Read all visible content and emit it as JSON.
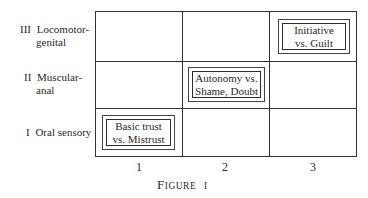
{
  "figure": {
    "caption_first": "F",
    "caption_rest": "igure",
    "caption_num": "I",
    "rows": [
      {
        "numeral": "III",
        "label_line1": "Locomotor-",
        "label_line2": "genital"
      },
      {
        "numeral": "II",
        "label_line1": "Muscular-",
        "label_line2": "anal"
      },
      {
        "numeral": "I",
        "label_line1": "Oral sensory",
        "label_line2": ""
      }
    ],
    "columns": [
      "1",
      "2",
      "3"
    ],
    "cells": [
      {
        "row": "III",
        "col": "3",
        "line1": "Initiative",
        "line2": "vs. Guilt"
      },
      {
        "row": "II",
        "col": "2",
        "line1": "Autonomy vs.",
        "line2": "Shame, Doubt"
      },
      {
        "row": "I",
        "col": "1",
        "line1": "Basic trust",
        "line2": "vs. Mistrust"
      }
    ]
  }
}
